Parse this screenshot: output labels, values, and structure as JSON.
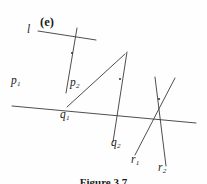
{
  "figure": {
    "part_label": "(e)",
    "caption": "Figure 3.7",
    "line_color": "#3a3a3a",
    "text_color": "#1b1b1b",
    "background": "#fefefe",
    "width": 207,
    "height": 184,
    "labels": [
      {
        "name": "line-l",
        "text": "l",
        "sub": "",
        "x": 27,
        "y": 24
      },
      {
        "name": "line-p1",
        "text": "p",
        "sub": "1",
        "x": 11,
        "y": 75
      },
      {
        "name": "line-p2",
        "text": "p",
        "sub": "2",
        "x": 70,
        "y": 77
      },
      {
        "name": "line-q1",
        "text": "q",
        "sub": "1",
        "x": 60,
        "y": 109
      },
      {
        "name": "line-q2",
        "text": "q",
        "sub": "2",
        "x": 111,
        "y": 137
      },
      {
        "name": "line-r1",
        "text": "r",
        "sub": "1",
        "x": 131,
        "y": 154
      },
      {
        "name": "line-r2",
        "text": "r",
        "sub": "2",
        "x": 158,
        "y": 162
      }
    ],
    "part_label_pos": {
      "x": 40,
      "y": 16
    },
    "caption_pos": {
      "y": 176
    },
    "lines": [
      {
        "name": "line-l",
        "x1": 12,
        "y1": 106,
        "x2": 196,
        "y2": 123
      },
      {
        "name": "line-p1",
        "x1": 38,
        "y1": 31,
        "x2": 96,
        "y2": 40
      },
      {
        "name": "line-p2",
        "x1": 77,
        "y1": 28,
        "x2": 66,
        "y2": 93
      },
      {
        "name": "line-q1",
        "x1": 67,
        "y1": 107,
        "x2": 125,
        "y2": 54
      },
      {
        "name": "line-q2",
        "x1": 127,
        "y1": 52,
        "x2": 113,
        "y2": 142
      },
      {
        "name": "line-r1",
        "x1": 135,
        "y1": 155,
        "x2": 175,
        "y2": 78
      },
      {
        "name": "line-r2",
        "x1": 155,
        "y1": 77,
        "x2": 166,
        "y2": 166
      }
    ],
    "intersections": [
      {
        "name": "intersection-p",
        "x": 72,
        "y": 53
      },
      {
        "name": "intersection-q",
        "x": 120,
        "y": 79
      },
      {
        "name": "intersection-r",
        "x": 159,
        "y": 99
      }
    ]
  }
}
